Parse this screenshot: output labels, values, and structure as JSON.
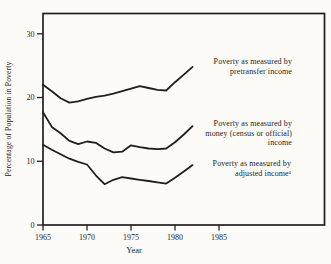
{
  "colors": {
    "ink": "#1f1f1f",
    "background": "#fcfbf8"
  },
  "chart_data": {
    "type": "line",
    "title": "",
    "xlabel": "Year",
    "ylabel": "Percentage of Population in Poverty",
    "x": [
      1965,
      1966,
      1967,
      1968,
      1969,
      1970,
      1971,
      1972,
      1973,
      1974,
      1975,
      1976,
      1977,
      1978,
      1979,
      1980,
      1981,
      1982
    ],
    "x_ticks": [
      1965,
      1970,
      1975,
      1980,
      1985
    ],
    "y_ticks": [
      0,
      10,
      20,
      30
    ],
    "xlim": [
      1965,
      1997
    ],
    "ylim": [
      0,
      33
    ],
    "grid": false,
    "legend_position": "inline-annotations",
    "series": [
      {
        "name": "pretransfer-income",
        "label": "Poverty as measured by\npretransfer income",
        "values": [
          22.0,
          21.0,
          19.9,
          19.2,
          19.4,
          19.8,
          20.1,
          20.3,
          20.6,
          21.0,
          21.4,
          21.8,
          21.5,
          21.2,
          21.1,
          22.4,
          23.6,
          24.8
        ]
      },
      {
        "name": "money-income",
        "label": "Poverty as measured by\nmoney (census or official)\nincome",
        "values": [
          17.7,
          15.4,
          14.4,
          13.2,
          12.7,
          13.1,
          12.9,
          12.0,
          11.4,
          11.5,
          12.5,
          12.2,
          12.0,
          11.9,
          12.0,
          13.0,
          14.2,
          15.5
        ]
      },
      {
        "name": "adjusted-income",
        "label": "Poverty as measured by\nadjusted incomeᵃ",
        "values": [
          12.6,
          11.8,
          11.1,
          10.4,
          9.9,
          9.5,
          7.8,
          6.4,
          7.1,
          7.5,
          7.3,
          7.1,
          6.9,
          6.7,
          6.5,
          7.4,
          8.4,
          9.4
        ]
      }
    ]
  }
}
